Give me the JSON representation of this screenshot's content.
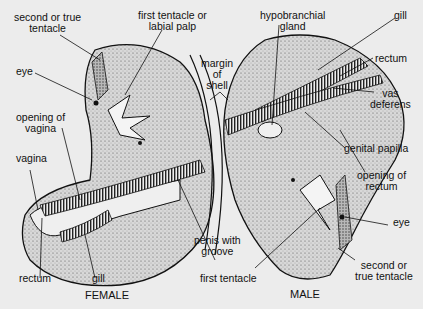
{
  "figure": {
    "captions": {
      "female": "FEMALE",
      "male": "MALE"
    },
    "labels": {
      "female_second_tentacle": [
        "second or true",
        "tentacle"
      ],
      "female_first_tentacle": [
        "first tentacle or",
        "labial palp"
      ],
      "female_eye": "eye",
      "female_opening_vagina": [
        "opening of",
        "vagina"
      ],
      "female_vagina": "vagina",
      "female_rectum": "rectum",
      "female_gill": "gill",
      "margin_of_shell": [
        "margin",
        "of",
        "shell"
      ],
      "penis_with_groove": [
        "penis with",
        "groove"
      ],
      "male_first_tentacle": "first tentacle",
      "male_hypobranchial_gland": [
        "hypobranchial",
        "gland"
      ],
      "male_gill": "gill",
      "male_rectum": "rectum",
      "male_vas_deferens": [
        "vas",
        "deferens"
      ],
      "male_genital_papilla": "genital papilla",
      "male_opening_rectum": [
        "opening of",
        "rectum"
      ],
      "male_eye": "eye",
      "male_second_tentacle": [
        "second or",
        "true tentacle"
      ]
    }
  }
}
